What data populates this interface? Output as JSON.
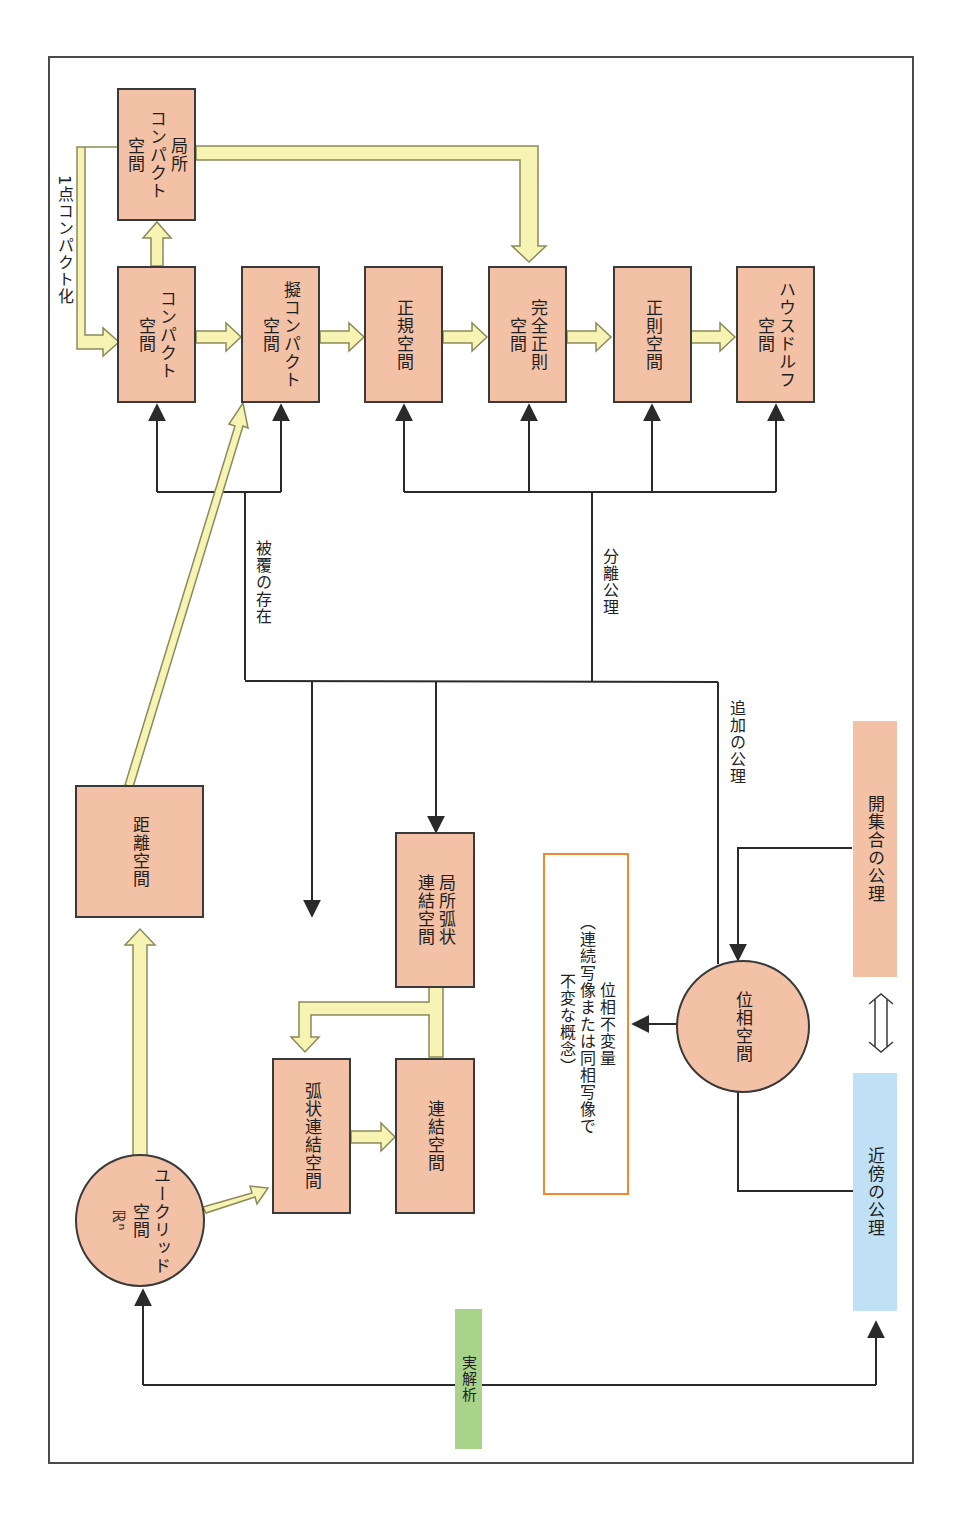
{
  "diagram": {
    "orientation": "rotated 90deg (text reads top-to-bottom)",
    "colors": {
      "space_box_fill": "#f3c2a6",
      "box_border": "#3a3a3a",
      "yellow_arrow_fill": "#f7f3b3",
      "yellow_arrow_border": "#8a8a5a",
      "open_set_axiom_fill": "#f3c2a6",
      "neighborhood_axiom_fill": "#bfe0f5",
      "real_analysis_fill": "#a9d38a",
      "invariant_border": "#f08a2c",
      "line_color": "#2a2a2a"
    },
    "nodes": {
      "local_compact": "局所\nコンパクト\n空間",
      "compact": "コンパクト\n空間",
      "quasi_compact": "擬コンパクト\n空間",
      "normal": "正規空間",
      "completely_regular": "完全正則\n空間",
      "regular": "正則空間",
      "hausdorff": "ハウスドルフ\n空間",
      "metric": "距離空間",
      "euclidean": "ユークリッド\n空間\nℝⁿ",
      "arc_connected": "弧状連結空間",
      "connected": "連結空間",
      "local_arc_connected": "局所弧状\n連結空間",
      "topological_space": "位相空間"
    },
    "labels": {
      "one_point_compactification": "1点コンパクト化",
      "existence_of_cover": "被覆の存在",
      "separation_axiom": "分離公理",
      "additional_axiom": "追加の公理"
    },
    "invariant_box": {
      "text": "位相不変量\n（連続写像または同相写像で\n不変な概念）"
    },
    "legend": {
      "open_set_axiom": "開集合の公理",
      "neighborhood_axiom": "近傍の公理",
      "equivalence_symbol": "⇔",
      "real_analysis": "実解析"
    }
  }
}
